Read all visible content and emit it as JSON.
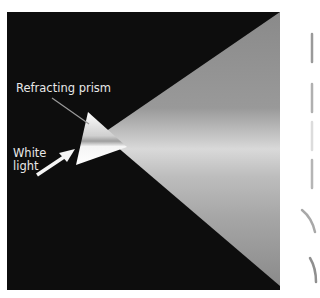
{
  "diagram": {
    "labels": {
      "prism": "Refracting prism",
      "light_line1": "White",
      "light_line2": "light"
    },
    "colors": {
      "background": "#0d0d0d",
      "beam": "#8c8c8c",
      "prism": "#f2f2f2",
      "label": "#e8e8e8"
    }
  }
}
